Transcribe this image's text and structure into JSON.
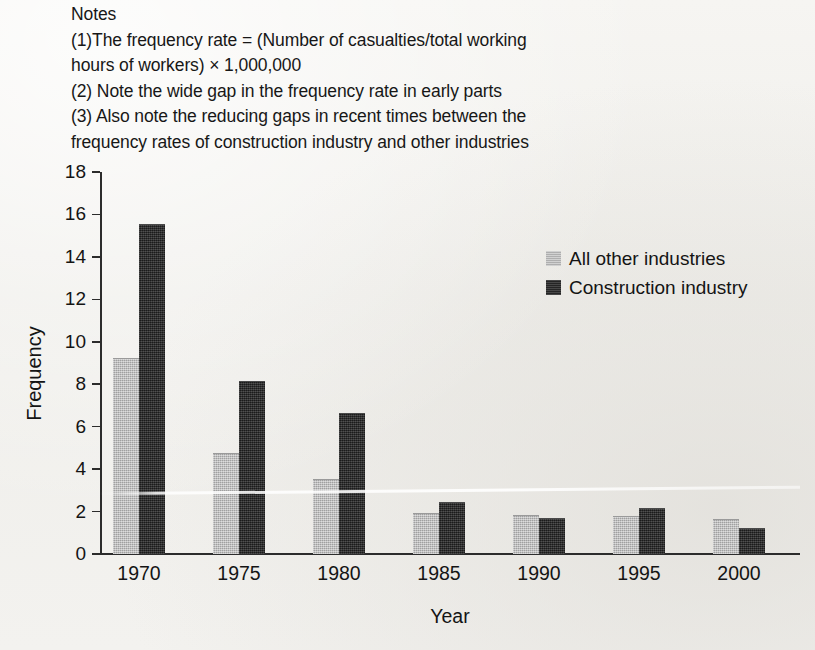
{
  "notes": {
    "heading": "Notes",
    "lines": [
      "Notes",
      "(1)The frequency rate = (Number of casualties/total working",
      "hours of workers) × 1,000,000",
      "(2) Note the wide gap in the frequency rate in early parts",
      "(3) Also note the reducing gaps in recent times between the",
      "frequency rates of construction industry and other industries"
    ]
  },
  "legend": {
    "position": "top-right",
    "items": [
      {
        "label": "All other industries",
        "color": "#b3b3b3",
        "swatch": "light-gray-square"
      },
      {
        "label": "Construction industry",
        "color": "#2b2b2b",
        "swatch": "dark-square"
      }
    ]
  },
  "chart_data": {
    "type": "bar",
    "title": "",
    "xlabel": "Year",
    "ylabel": "Frequency",
    "categories": [
      "1970",
      "1975",
      "1980",
      "1985",
      "1990",
      "1995",
      "2000"
    ],
    "series": [
      {
        "name": "All other industries",
        "color": "#b3b3b3",
        "values": [
          9.2,
          4.7,
          3.5,
          1.9,
          1.8,
          1.75,
          1.6
        ]
      },
      {
        "name": "Construction industry",
        "color": "#2b2b2b",
        "values": [
          15.5,
          8.1,
          6.6,
          2.4,
          1.65,
          2.1,
          1.2
        ]
      }
    ],
    "ylim": [
      0,
      18
    ],
    "yticks": [
      0,
      2,
      4,
      6,
      8,
      10,
      12,
      14,
      16,
      18
    ],
    "ytick_labels": [
      "0",
      "2",
      "4",
      "6",
      "8",
      "10",
      "12",
      "14",
      "16",
      "18"
    ],
    "grid": false,
    "legend_position": "upper right"
  }
}
